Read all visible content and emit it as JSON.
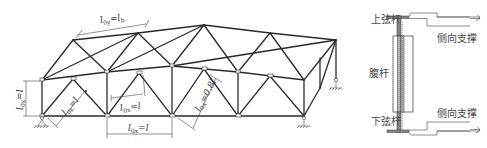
{
  "figure": {
    "left_diagram": {
      "description": "Space truss with lateral bracing between top chords",
      "labels": {
        "top_chord_out_of_plane": {
          "l": "l",
          "sub": "0y",
          "eq": "=",
          "rhs_l": "l",
          "rhs_sub": "b"
        },
        "end_post": {
          "l": "l",
          "sub": "0x",
          "eq": "=",
          "rhs": "l"
        },
        "end_diagonal": {
          "l": "l",
          "sub": "0x",
          "eq": "=",
          "rhs": "l"
        },
        "web_member": {
          "l": "l",
          "sub": "0x",
          "eq": "=",
          "rhs": "l"
        },
        "bottom_chord_panel": {
          "l": "l",
          "sub": "0x",
          "eq": "=",
          "rhs": "l"
        },
        "inner_diagonal": {
          "l": "l",
          "sub": "0x",
          "eq": "=",
          "rhs": "0.8l"
        }
      }
    },
    "right_diagram": {
      "description": "Cross-section detail of truss member connections",
      "labels": {
        "top_chord": "上弦杆",
        "web_member": "腹杆",
        "bottom_chord": "下弦杆",
        "lateral_bracing_top": "侧向支撑",
        "lateral_bracing_bottom": "侧向支撑"
      }
    }
  }
}
